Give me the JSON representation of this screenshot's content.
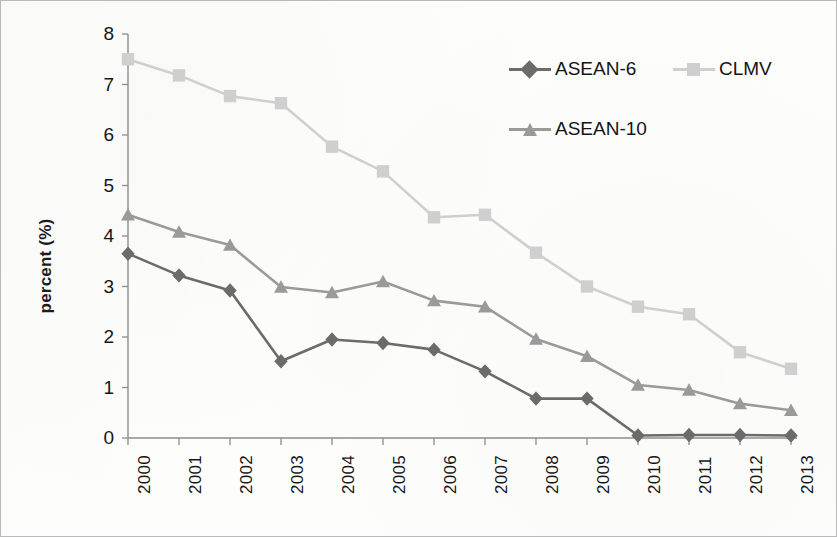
{
  "figure": {
    "background_color": "#fdfdfc",
    "border_color": "#b9b9b9"
  },
  "axes": {
    "y_axis_title": "percent (%)",
    "y_ticks": [
      "0",
      "1",
      "2",
      "3",
      "4",
      "5",
      "6",
      "7",
      "8"
    ],
    "x_ticks": [
      "2000",
      "2001",
      "2002",
      "2003",
      "2004",
      "2005",
      "2006",
      "2007",
      "2008",
      "2009",
      "2010",
      "2011",
      "2012",
      "2013"
    ]
  },
  "legend": {
    "items": [
      {
        "label": "ASEAN-6",
        "color": "#6b6b6b",
        "marker": "diamond"
      },
      {
        "label": "CLMV",
        "color": "#cfcfcf",
        "marker": "square"
      },
      {
        "label": "ASEAN-10",
        "color": "#9a9a9a",
        "marker": "triangle"
      }
    ]
  },
  "chart_data": {
    "type": "line",
    "title": "",
    "xlabel": "",
    "ylabel": "percent (%)",
    "x": [
      "2000",
      "2001",
      "2002",
      "2003",
      "2004",
      "2005",
      "2006",
      "2007",
      "2008",
      "2009",
      "2010",
      "2011",
      "2012",
      "2013"
    ],
    "xlim": [
      0,
      13
    ],
    "ylim": [
      0,
      8
    ],
    "y_tick_step": 1,
    "grid": false,
    "legend_position": "top-right-inside",
    "series": [
      {
        "name": "ASEAN-6",
        "color": "#6b6b6b",
        "marker": "diamond",
        "values": [
          3.65,
          3.22,
          2.92,
          1.52,
          1.95,
          1.88,
          1.75,
          1.32,
          0.78,
          0.78,
          0.05,
          0.06,
          0.06,
          0.05
        ]
      },
      {
        "name": "CLMV",
        "color": "#cfcfcf",
        "marker": "square",
        "values": [
          7.5,
          7.18,
          6.77,
          6.63,
          5.77,
          5.28,
          4.37,
          4.42,
          3.67,
          3.0,
          2.6,
          2.45,
          1.7,
          1.37
        ]
      },
      {
        "name": "ASEAN-10",
        "color": "#9a9a9a",
        "marker": "triangle",
        "values": [
          4.42,
          4.08,
          3.82,
          2.99,
          2.88,
          3.1,
          2.72,
          2.6,
          1.96,
          1.62,
          1.05,
          0.95,
          0.68,
          0.55
        ]
      }
    ]
  }
}
